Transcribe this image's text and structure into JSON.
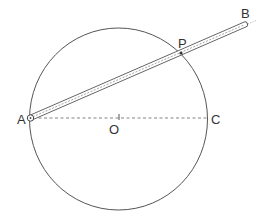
{
  "diagram": {
    "type": "geometry",
    "colors": {
      "stroke": "#555555",
      "label": "#333333",
      "background": "#ffffff"
    },
    "circle": {
      "center_label": "O",
      "cx": 118.5,
      "cy": 119,
      "rx": 89,
      "ry": 91
    },
    "points": [
      {
        "id": "A",
        "label": "A",
        "x": 30,
        "y": 118
      },
      {
        "id": "O",
        "label": "O",
        "x": 119,
        "y": 117
      },
      {
        "id": "C",
        "label": "C",
        "x": 207,
        "y": 118
      },
      {
        "id": "P",
        "label": "P",
        "x": 181,
        "y": 53
      },
      {
        "id": "B",
        "label": "B",
        "x": 247,
        "y": 25
      }
    ],
    "segments": [
      {
        "from": "A",
        "to": "C",
        "style": "dashed"
      },
      {
        "from": "A",
        "to": "B",
        "style": "rod"
      }
    ],
    "labels": {
      "A": "A",
      "B": "B",
      "C": "C",
      "O": "O",
      "P": "P"
    }
  }
}
